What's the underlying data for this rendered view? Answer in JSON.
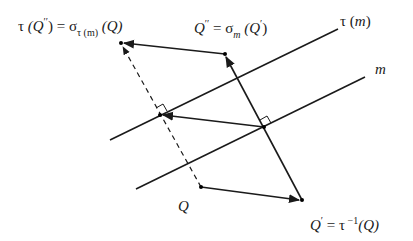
{
  "diagram": {
    "colors": {
      "stroke": "#1a1a1a",
      "background": "#ffffff"
    },
    "lines": [
      {
        "id": "tau-m",
        "label": "τ (m)",
        "from": [
          110,
          140
        ],
        "to": [
          338,
          29
        ]
      },
      {
        "id": "m",
        "label": "m",
        "from": [
          136,
          189
        ],
        "to": [
          365,
          77
        ]
      }
    ],
    "points": {
      "Q": [
        201,
        187
      ],
      "Q_prime": [
        302,
        200
      ],
      "Q_double_prime": [
        225,
        54
      ],
      "tau_Q_double_prime": [
        121,
        43
      ],
      "foot_on_m": [
        264,
        127
      ],
      "foot_on_tau_m": [
        160,
        115
      ]
    },
    "labels": {
      "tau_m": {
        "tau": "τ",
        "open": " (",
        "m": "m",
        "close": ")"
      },
      "m": "m",
      "Q": "Q",
      "q_prime": {
        "Q": "Q",
        "prime": "′",
        "eq": " = τ",
        "inv": " −1",
        "arg": "(Q)"
      },
      "q_double_prime": {
        "Q": "Q",
        "prime": "′′",
        "eq": " = σ",
        "sub": "m",
        "arg_open": " (Q",
        "arg_prime": "′",
        "arg_close": ")"
      },
      "tau_q_double_prime": {
        "tau": "τ",
        "arg_open": " (Q",
        "prime": "′′",
        "arg_close": ")",
        "eq": " = σ",
        "sub": "τ (m)",
        "arg": " (Q)"
      }
    }
  }
}
